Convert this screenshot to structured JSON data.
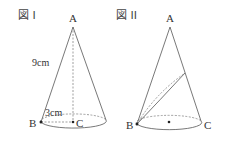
{
  "figures": [
    {
      "title": "図 I",
      "labels": {
        "apex": "A",
        "left": "B",
        "center": "C",
        "slant": "9cm",
        "radius": "3cm"
      }
    },
    {
      "title": "図 II",
      "labels": {
        "apex": "A",
        "left": "B",
        "right": "C"
      }
    }
  ],
  "colors": {
    "line": "#444444",
    "text": "#333333"
  }
}
